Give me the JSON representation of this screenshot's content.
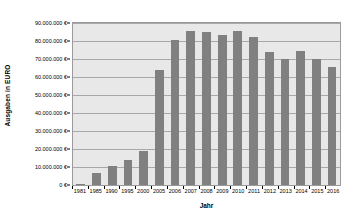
{
  "chart_data": {
    "type": "bar",
    "title": "",
    "subtitle": "",
    "xlabel": "Jahr",
    "ylabel": "Ausgaben in EURO",
    "categories": [
      "1981",
      "1985",
      "1990",
      "1995",
      "2000",
      "2005",
      "2006",
      "2007",
      "2008",
      "2009",
      "2010",
      "2011",
      "2012",
      "2013",
      "2014",
      "2015",
      "2016"
    ],
    "values": [
      500000,
      6500000,
      10700000,
      14100000,
      19000000,
      63700000,
      80300000,
      85600000,
      85200000,
      83100000,
      85400000,
      82100000,
      73700000,
      70000000,
      74300000,
      70100000,
      65600000
    ],
    "series": [
      {
        "name": "Ausgaben",
        "values": [
          500000,
          6500000,
          10700000,
          14100000,
          19000000,
          63700000,
          80300000,
          85600000,
          85200000,
          83100000,
          85400000,
          82100000,
          73700000,
          70000000,
          74300000,
          70100000,
          65600000
        ]
      }
    ],
    "ylim": [
      0,
      90000000
    ],
    "ytick_values": [
      0,
      10000000,
      20000000,
      30000000,
      40000000,
      50000000,
      60000000,
      70000000,
      80000000,
      90000000
    ],
    "ytick_labels": [
      "0 €",
      "10.000.000 €",
      "20.000.000 €",
      "30.000.000 €",
      "40.000.000 €",
      "50.000.000 €",
      "60.000.000 €",
      "70.000.000 €",
      "80.000.000 €",
      "90.000.000 €"
    ],
    "grid": true,
    "grid_axis": "y",
    "legend": false,
    "legend_position": "none",
    "bar_color": "#808080",
    "plot_background": "#e8e8e8",
    "gridline_color": "#a8a8a8",
    "figure_background": "#ffffff"
  }
}
